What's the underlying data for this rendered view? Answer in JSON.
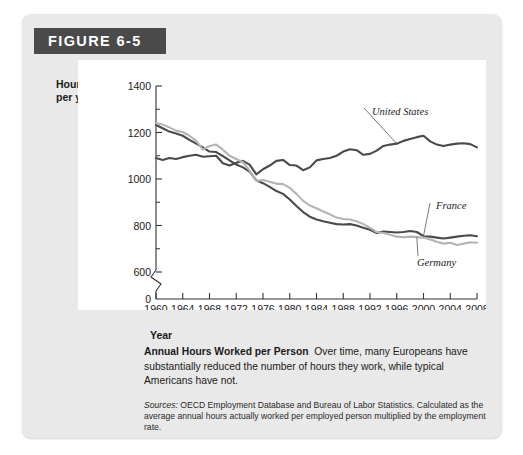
{
  "figure": {
    "title": "FIGURE 6-5",
    "title_bg": "#4a4a4a",
    "panel_bg": "#e9e9e9"
  },
  "caption": {
    "heading": "Annual Hours Worked per Person",
    "body": "Over time, many Europeans have substantially reduced the number of hours they work, while typical Americans have not.",
    "sources_label": "Sources:",
    "sources_body": "OECD Employment Database and Bureau of Labor Statistics. Calculated as the average annual hours actually worked per employed person multiplied by the employment rate."
  },
  "chart_data": {
    "type": "line",
    "title": "Annual Hours Worked per Person",
    "xlabel": "Year",
    "ylabel": "Hours per year",
    "ylabel_line1": "Hours",
    "ylabel_line2": "per year",
    "xlim": [
      1960,
      2008
    ],
    "ylim": [
      600,
      1400
    ],
    "y_axis_break": true,
    "y_break_from": 0,
    "y_break_to": 600,
    "grid": false,
    "legend_position": "inline-annotations",
    "yticks": [
      0,
      600,
      800,
      1000,
      1200,
      1400
    ],
    "ytick_labels": [
      "0",
      "600",
      "800",
      "1000",
      "1200",
      "1400"
    ],
    "yminor_ticks": [
      700,
      900,
      1100,
      1300
    ],
    "xticks": [
      1960,
      1964,
      1968,
      1972,
      1976,
      1980,
      1984,
      1988,
      1992,
      1996,
      2000,
      2004,
      2008
    ],
    "xtick_labels": [
      "1960",
      "1964",
      "1968",
      "1972",
      "1976",
      "1980",
      "1984",
      "1988",
      "1992",
      "1996",
      "2000",
      "2004",
      "2008"
    ],
    "x": [
      1960,
      1961,
      1962,
      1963,
      1964,
      1965,
      1966,
      1967,
      1968,
      1969,
      1970,
      1971,
      1972,
      1973,
      1974,
      1975,
      1976,
      1977,
      1978,
      1979,
      1980,
      1981,
      1982,
      1983,
      1984,
      1985,
      1986,
      1987,
      1988,
      1989,
      1990,
      1991,
      1992,
      1993,
      1994,
      1995,
      1996,
      1997,
      1998,
      1999,
      2000,
      2001,
      2002,
      2003,
      2004,
      2005,
      2006,
      2007,
      2008
    ],
    "series": [
      {
        "name": "United States",
        "color": "#4a4a4a",
        "values": [
          1090,
          1082,
          1090,
          1086,
          1094,
          1100,
          1104,
          1096,
          1098,
          1100,
          1068,
          1058,
          1070,
          1078,
          1062,
          1020,
          1042,
          1058,
          1078,
          1082,
          1060,
          1058,
          1038,
          1050,
          1080,
          1086,
          1090,
          1100,
          1118,
          1128,
          1124,
          1104,
          1108,
          1122,
          1142,
          1148,
          1152,
          1164,
          1172,
          1180,
          1186,
          1162,
          1148,
          1142,
          1148,
          1152,
          1154,
          1150,
          1136
        ]
      },
      {
        "name": "France",
        "color": "#4a4a4a",
        "values": [
          1232,
          1218,
          1204,
          1196,
          1186,
          1168,
          1152,
          1136,
          1118,
          1116,
          1098,
          1080,
          1062,
          1050,
          1032,
          994,
          982,
          966,
          948,
          936,
          912,
          884,
          858,
          838,
          826,
          818,
          812,
          806,
          804,
          806,
          800,
          790,
          782,
          768,
          774,
          772,
          770,
          772,
          776,
          772,
          754,
          752,
          748,
          744,
          748,
          752,
          756,
          758,
          754
        ]
      },
      {
        "name": "Germany",
        "color": "#b4b4b4",
        "values": [
          1240,
          1234,
          1222,
          1208,
          1202,
          1186,
          1164,
          1126,
          1142,
          1148,
          1126,
          1100,
          1086,
          1072,
          1036,
          992,
          996,
          988,
          980,
          978,
          962,
          936,
          906,
          886,
          874,
          860,
          848,
          834,
          828,
          826,
          818,
          806,
          790,
          772,
          768,
          760,
          752,
          750,
          752,
          750,
          748,
          740,
          730,
          722,
          726,
          716,
          722,
          728,
          726
        ]
      }
    ],
    "annotations": [
      {
        "text": "United States",
        "series": "United States",
        "at_year": 1996
      },
      {
        "text": "France",
        "series": "France",
        "at_year": 2000
      },
      {
        "text": "Germany",
        "series": "Germany",
        "at_year": 1999
      }
    ]
  }
}
